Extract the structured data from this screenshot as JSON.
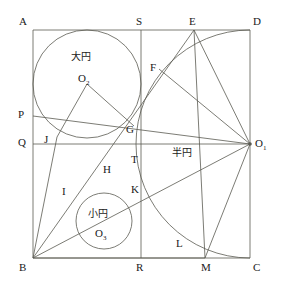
{
  "figure": {
    "kind": "sangaku-geometry-diagram",
    "stroke_color": "#5a5a52",
    "label_color": "#1a1a1a",
    "background": "#ffffff",
    "width": 282,
    "height": 288
  },
  "square": {
    "name": "ABCD",
    "left": 33,
    "top": 30,
    "right": 250,
    "bottom": 258
  },
  "labels": {
    "A": "A",
    "B": "B",
    "C": "C",
    "D": "D",
    "E": "E",
    "F": "F",
    "G": "G",
    "H": "H",
    "I": "I",
    "J": "J",
    "K": "K",
    "L": "L",
    "M": "M",
    "P": "P",
    "Q": "Q",
    "R": "R",
    "S": "S",
    "T": "T",
    "O1": "O",
    "O1_sub": "1",
    "O2": "O",
    "O2_sub": "2",
    "O3": "O",
    "O3_sub": "3",
    "big_circle": "大円",
    "small_circle": "小円",
    "semicircle": "半円"
  },
  "points": {
    "A": {
      "x": 33,
      "y": 30
    },
    "B": {
      "x": 33,
      "y": 258
    },
    "C": {
      "x": 250,
      "y": 258
    },
    "D": {
      "x": 250,
      "y": 30
    },
    "E": {
      "x": 194,
      "y": 30
    },
    "F": {
      "x": 159,
      "y": 69
    },
    "G": {
      "x": 134,
      "y": 126
    },
    "H": {
      "x": 114,
      "y": 167
    },
    "I": {
      "x": 79,
      "y": 199
    },
    "J": {
      "x": 57,
      "y": 137
    },
    "K": {
      "x": 141,
      "y": 194
    },
    "L": {
      "x": 186,
      "y": 244
    },
    "M": {
      "x": 205,
      "y": 258
    },
    "P": {
      "x": 33,
      "y": 116
    },
    "Q": {
      "x": 33,
      "y": 144
    },
    "R": {
      "x": 141,
      "y": 258
    },
    "S": {
      "x": 141,
      "y": 30
    },
    "T": {
      "x": 141,
      "y": 144
    },
    "O1": {
      "x": 250,
      "y": 144
    },
    "O2": {
      "x": 87,
      "y": 84
    },
    "O3": {
      "x": 104,
      "y": 221
    }
  },
  "circles": [
    {
      "name": "big-circle",
      "cx": 87,
      "cy": 84,
      "r": 54
    },
    {
      "name": "small-circle",
      "cx": 104,
      "cy": 221,
      "r": 28
    }
  ],
  "semicircle_arc": {
    "name": "semicircle-O1",
    "cx": 250,
    "cy": 144,
    "r": 114,
    "from_x": 250,
    "from_y": 30,
    "to_x": 250,
    "to_y": 258
  },
  "segments": [
    {
      "name": "side-AD",
      "x1": 33,
      "y1": 30,
      "x2": 250,
      "y2": 30
    },
    {
      "name": "side-DC",
      "x1": 250,
      "y1": 30,
      "x2": 250,
      "y2": 258
    },
    {
      "name": "side-BC",
      "x1": 33,
      "y1": 258,
      "x2": 250,
      "y2": 258
    },
    {
      "name": "side-AB",
      "x1": 33,
      "y1": 30,
      "x2": 33,
      "y2": 258
    },
    {
      "name": "line-SR",
      "x1": 141,
      "y1": 30,
      "x2": 141,
      "y2": 258
    },
    {
      "name": "line-QO1",
      "x1": 33,
      "y1": 144,
      "x2": 250,
      "y2": 144
    },
    {
      "name": "line-BE",
      "x1": 33,
      "y1": 258,
      "x2": 194,
      "y2": 30
    },
    {
      "name": "line-EO1",
      "x1": 194,
      "y1": 30,
      "x2": 250,
      "y2": 144
    },
    {
      "name": "line-FO1",
      "x1": 159,
      "y1": 69,
      "x2": 250,
      "y2": 144
    },
    {
      "name": "line-BO1",
      "x1": 33,
      "y1": 258,
      "x2": 250,
      "y2": 144
    },
    {
      "name": "line-PO1",
      "x1": 33,
      "y1": 116,
      "x2": 250,
      "y2": 144
    },
    {
      "name": "line-BM",
      "x1": 33,
      "y1": 258,
      "x2": 205,
      "y2": 258
    },
    {
      "name": "line-O1M",
      "x1": 250,
      "y1": 144,
      "x2": 205,
      "y2": 258
    },
    {
      "name": "line-EM",
      "x1": 194,
      "y1": 30,
      "x2": 205,
      "y2": 258
    },
    {
      "name": "line-O2J",
      "x1": 87,
      "y1": 84,
      "x2": 57,
      "y2": 137
    },
    {
      "name": "line-O2G",
      "x1": 87,
      "y1": 84,
      "x2": 134,
      "y2": 126
    },
    {
      "name": "line-JB",
      "x1": 57,
      "y1": 137,
      "x2": 33,
      "y2": 258
    }
  ],
  "label_positions": {
    "A": {
      "x": 19,
      "y": 16
    },
    "S": {
      "x": 136,
      "y": 16
    },
    "E": {
      "x": 189,
      "y": 16
    },
    "D": {
      "x": 253,
      "y": 16
    },
    "F": {
      "x": 150,
      "y": 62
    },
    "P": {
      "x": 18,
      "y": 109
    },
    "G": {
      "x": 126,
      "y": 124
    },
    "J": {
      "x": 44,
      "y": 134
    },
    "Q": {
      "x": 18,
      "y": 137
    },
    "O1": {
      "x": 255,
      "y": 138
    },
    "T": {
      "x": 131,
      "y": 154
    },
    "H": {
      "x": 103,
      "y": 164
    },
    "I": {
      "x": 62,
      "y": 186
    },
    "K": {
      "x": 131,
      "y": 184
    },
    "L": {
      "x": 176,
      "y": 238
    },
    "B": {
      "x": 19,
      "y": 262
    },
    "R": {
      "x": 136,
      "y": 262
    },
    "M": {
      "x": 201,
      "y": 262
    },
    "C": {
      "x": 253,
      "y": 262
    },
    "O2": {
      "x": 78,
      "y": 73
    },
    "O3": {
      "x": 95,
      "y": 228
    },
    "big_circle": {
      "x": 71,
      "y": 52
    },
    "small_circle": {
      "x": 88,
      "y": 209
    },
    "semicircle": {
      "x": 172,
      "y": 148
    }
  }
}
